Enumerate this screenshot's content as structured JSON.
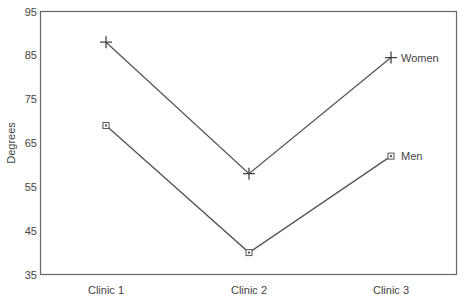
{
  "chart_data": {
    "type": "line",
    "title": "",
    "xlabel": "",
    "ylabel": "Degrees",
    "categories": [
      "Clinic 1",
      "Clinic 2",
      "Clinic 3"
    ],
    "ylim": [
      35,
      95
    ],
    "yticks": [
      35,
      45,
      55,
      65,
      75,
      85,
      95
    ],
    "grid": false,
    "legend": "inline labels at right end of each line",
    "series": [
      {
        "name": "Women",
        "marker": "plus",
        "values": [
          88,
          58,
          84.5
        ]
      },
      {
        "name": "Men",
        "marker": "square",
        "values": [
          69,
          40,
          62
        ]
      }
    ]
  },
  "colors": {
    "line": "#555555",
    "axis": "#666666",
    "text": "#444444"
  }
}
